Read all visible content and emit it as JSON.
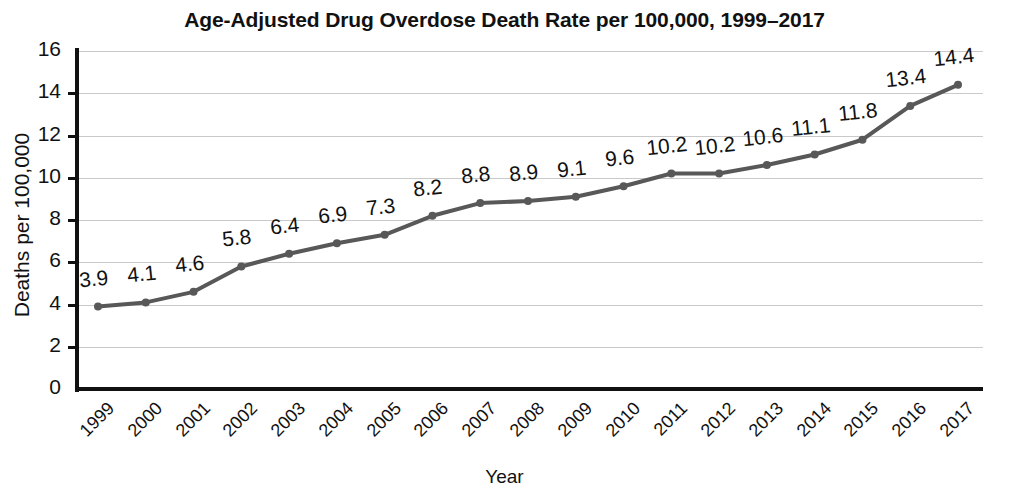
{
  "chart_data": {
    "type": "line",
    "title": "Age-Adjusted Drug Overdose Death Rate per 100,000, 1999–2017",
    "xlabel": "Year",
    "ylabel": "Deaths per 100,000",
    "categories": [
      "1999",
      "2000",
      "2001",
      "2002",
      "2003",
      "2004",
      "2005",
      "2006",
      "2007",
      "2008",
      "2009",
      "2010",
      "2011",
      "2012",
      "2013",
      "2014",
      "2015",
      "2016",
      "2017"
    ],
    "values": [
      3.9,
      4.1,
      4.6,
      5.8,
      6.4,
      6.9,
      7.3,
      8.2,
      8.8,
      8.9,
      9.1,
      9.6,
      10.2,
      10.2,
      10.6,
      11.1,
      11.8,
      13.4,
      14.4
    ],
    "data_labels": [
      "3.9",
      "4.1",
      "4.6",
      "5.8",
      "6.4",
      "6.9",
      "7.3",
      "8.2",
      "8.8",
      "8.9",
      "9.1",
      "9.6",
      "10.2",
      "10.2",
      "10.6",
      "11.1",
      "11.8",
      "13.4",
      "14.4"
    ],
    "ylim": [
      0,
      16
    ],
    "y_ticks": [
      0,
      2,
      4,
      6,
      8,
      10,
      12,
      14,
      16
    ],
    "y_tick_labels": [
      "0",
      "2",
      "4",
      "6",
      "8",
      "10",
      "12",
      "14",
      "16"
    ],
    "grid": true,
    "grid_axis": "y",
    "legend": false,
    "legend_position": "none",
    "series_color": "#585858",
    "grid_color": "#c9c9c9",
    "axis_color": "#111111",
    "marker": "circle",
    "marker_size": 8,
    "line_width": 4
  }
}
